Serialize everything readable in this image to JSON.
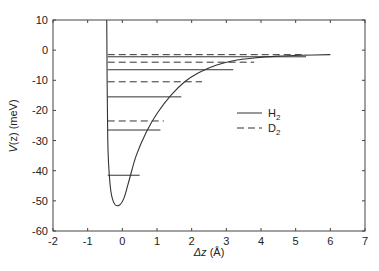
{
  "chart_data": {
    "type": "line",
    "title": "",
    "xlabel": "Δz (Å)",
    "ylabel": "V(z) (meV)",
    "xlim": [
      -2,
      7
    ],
    "ylim": [
      -60,
      10
    ],
    "xticks": [
      -2,
      -1,
      0,
      1,
      2,
      3,
      4,
      5,
      6,
      7
    ],
    "yticks": [
      10,
      0,
      -10,
      -20,
      -30,
      -40,
      -50,
      -60
    ],
    "grid": false,
    "legend_position": "center-right",
    "potential_curve": {
      "name": "V(z)",
      "wall_x": -0.45,
      "minimum": {
        "x": -0.1,
        "y": -51.5
      },
      "x": [
        -0.45,
        -0.42,
        -0.35,
        -0.25,
        -0.1,
        0.05,
        0.2,
        0.4,
        0.7,
        1.0,
        1.4,
        1.8,
        2.2,
        2.7,
        3.2,
        3.8,
        4.5,
        5.2,
        6.0
      ],
      "y": [
        10,
        -30,
        -45,
        -50.5,
        -51.5,
        -49,
        -43,
        -35,
        -27,
        -21,
        -15,
        -10.5,
        -7.5,
        -5,
        -3.5,
        -2.6,
        -2.0,
        -1.7,
        -1.5
      ]
    },
    "series": [
      {
        "name": "H2",
        "style": "solid",
        "levels_meV": [
          -41.5,
          -26.5,
          -15.5,
          -6.5,
          -2.2
        ],
        "x_end": [
          0.5,
          1.1,
          1.7,
          3.2,
          5.3
        ]
      },
      {
        "name": "D2",
        "style": "dashed",
        "levels_meV": [
          -23.5,
          -10.5,
          -4.0,
          -1.5
        ],
        "x_end": [
          1.2,
          2.3,
          3.8,
          5.3
        ]
      }
    ],
    "legend": [
      {
        "label": "H",
        "subscript": "2",
        "style": "solid"
      },
      {
        "label": "D",
        "subscript": "2",
        "style": "dashed"
      }
    ]
  },
  "axis": {
    "ylabel_main": "V",
    "ylabel_paren": "(z) (meV)",
    "xlabel_delta": "Δz",
    "xlabel_unit": " (Å)"
  }
}
